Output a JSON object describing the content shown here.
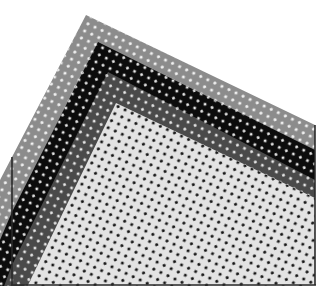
{
  "image": {
    "description": "Four overlapping polka-dot sheets stacked diagonally, apex at top-left, inside a thin rectangular frame",
    "width": 334,
    "height": 297,
    "background": "#ffffff",
    "frame": {
      "color": "#2a2a2a",
      "left": 12,
      "right": 315,
      "bottom": 285
    },
    "sheets": [
      {
        "name": "gray-sheet",
        "fill": "#8c8c8c",
        "dot": "#f2f2f2",
        "apex": [
          86,
          15
        ],
        "left_end": [
          12,
          157
        ],
        "right_end": [
          315,
          125
        ]
      },
      {
        "name": "black-sheet",
        "fill": "#0c0c0c",
        "dot": "#e8e8e8",
        "apex": [
          98,
          42
        ],
        "left_end": [
          12,
          212
        ],
        "right_end": [
          315,
          150
        ]
      },
      {
        "name": "dark-gray-sheet",
        "fill": "#4a4a4a",
        "dot": "#e2e2e2",
        "apex": [
          108,
          72
        ],
        "left_end": [
          12,
          265
        ],
        "right_end": [
          315,
          180
        ]
      },
      {
        "name": "light-sheet",
        "fill": "#e3e3e3",
        "dot": "#151515",
        "apex": [
          116,
          103
        ],
        "left_end": [
          28,
          285
        ],
        "right_end": [
          315,
          198
        ]
      }
    ]
  }
}
